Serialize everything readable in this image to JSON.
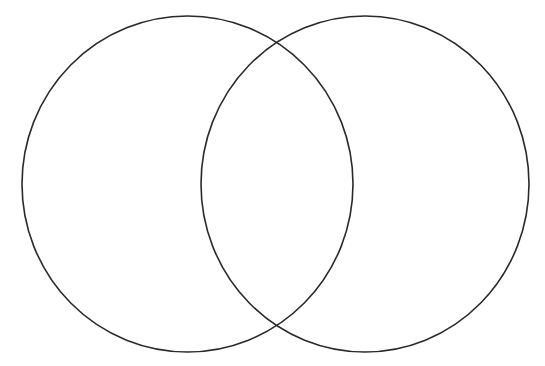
{
  "diagram": {
    "type": "venn",
    "background": "#ffffff",
    "stroke_color": "#2a2a2a",
    "stroke_width": 1.6,
    "circles": [
      {
        "name": "left-circle",
        "cx": 187.5,
        "cy": 184,
        "rx": 165.5,
        "ry": 168
      },
      {
        "name": "right-circle",
        "cx": 365,
        "cy": 184,
        "rx": 164,
        "ry": 168
      }
    ],
    "labels": []
  }
}
